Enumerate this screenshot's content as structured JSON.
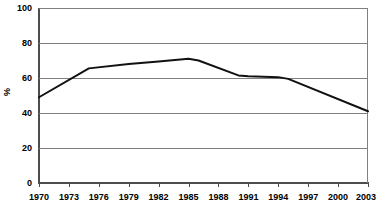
{
  "chart_data": {
    "type": "line",
    "title": "",
    "subtitle": "",
    "xlabel": "",
    "ylabel": "%",
    "ylim": [
      0,
      100
    ],
    "xlim": [
      1970,
      2003
    ],
    "grid": true,
    "legend": null,
    "y_ticks": [
      100,
      80,
      60,
      40,
      20,
      0
    ],
    "x_ticks": [
      "1970",
      "1973",
      "1976",
      "1979",
      "1982",
      "1985",
      "1988",
      "1991",
      "1994",
      "1997",
      "2000",
      "2003"
    ],
    "line_color": "#111111",
    "grid_color": "#808080",
    "axis_color": "#4d4d4d",
    "background_color": "#ffffff",
    "x": [
      1970,
      1975,
      1979,
      1982,
      1985,
      1986,
      1990,
      1991,
      1994,
      1995,
      2003
    ],
    "values": [
      49,
      65.5,
      68,
      69.5,
      71,
      70,
      61.5,
      61,
      60.5,
      59.5,
      41
    ],
    "series": [
      {
        "name": "",
        "points": [
          {
            "x": 1970,
            "y": 49
          },
          {
            "x": 1975,
            "y": 65.5
          },
          {
            "x": 1979,
            "y": 68
          },
          {
            "x": 1982,
            "y": 69.5
          },
          {
            "x": 1985,
            "y": 71
          },
          {
            "x": 1986,
            "y": 70
          },
          {
            "x": 1990,
            "y": 61.5
          },
          {
            "x": 1991,
            "y": 61
          },
          {
            "x": 1994,
            "y": 60.5
          },
          {
            "x": 1995,
            "y": 59.5
          },
          {
            "x": 2003,
            "y": 41
          }
        ]
      }
    ]
  }
}
